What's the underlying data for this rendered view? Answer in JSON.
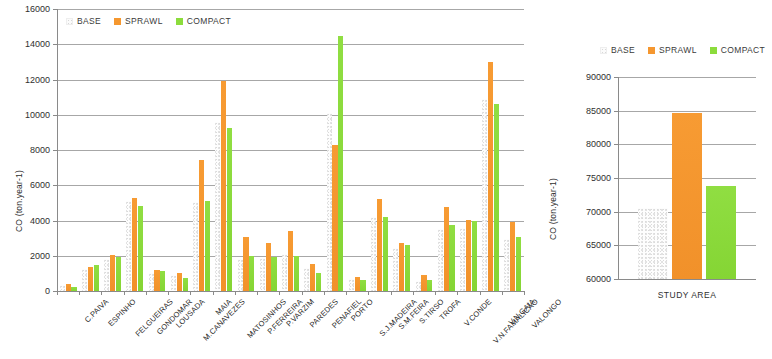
{
  "chart_data": [
    {
      "id": "municipality-chart",
      "type": "bar",
      "title": "",
      "xlabel": "",
      "ylabel": "CO (ton.year-1)",
      "ylim": [
        0,
        16000
      ],
      "ytick_step": 2000,
      "yticks": [
        "0",
        "2000",
        "4000",
        "6000",
        "8000",
        "10000",
        "12000",
        "14000",
        "16000"
      ],
      "grid": true,
      "legend_position": "top-left",
      "legend": [
        "BASE",
        "SPRAWL",
        "COMPACT"
      ],
      "colors": {
        "BASE": "#fafafa",
        "SPRAWL": "#f5972f",
        "COMPACT": "#8cdc3c"
      },
      "categories": [
        "C.PAIVA",
        "ESPINHO",
        "FELGUEIRAS",
        "GONDOMAR",
        "LOUSADA",
        "M.CANAVEZES",
        "MAIA",
        "MATOSINHOS",
        "P.FERREIRA",
        "P.VARZIM",
        "PAREDES",
        "PENAFIEL",
        "PORTO",
        "S.J.MADEIRA",
        "S.M.FEIRA",
        "S.TIRSO",
        "TROFA",
        "V.CONDE",
        "V.N.FAMALICÃO",
        "V.N.GAIA",
        "VALONGO"
      ],
      "series": [
        {
          "name": "BASE",
          "values": [
            330,
            1250,
            1800,
            5100,
            1050,
            900,
            5050,
            9600,
            1800,
            1850,
            2100,
            1300,
            10100,
            700,
            4200,
            2450,
            550,
            3500,
            3550,
            10900,
            2950
          ]
        },
        {
          "name": "SPRAWL",
          "values": [
            400,
            1350,
            2050,
            5250,
            1200,
            1000,
            7450,
            11900,
            3050,
            2750,
            3400,
            1550,
            8300,
            800,
            5200,
            2750,
            900,
            4750,
            4050,
            13000,
            3900
          ]
        },
        {
          "name": "COMPACT",
          "values": [
            250,
            1500,
            1950,
            4800,
            1150,
            750,
            5100,
            9250,
            2000,
            1950,
            2000,
            1050,
            14450,
            650,
            4200,
            2600,
            650,
            3750,
            3950,
            10600,
            3050
          ]
        }
      ]
    },
    {
      "id": "study-area-chart",
      "type": "bar",
      "title": "",
      "xlabel": "",
      "ylabel": "CO (ton.year-1)",
      "ylim": [
        60000,
        90000
      ],
      "ytick_step": 5000,
      "yticks": [
        "60000",
        "65000",
        "70000",
        "75000",
        "80000",
        "85000",
        "90000"
      ],
      "grid": true,
      "legend_position": "top",
      "legend": [
        "BASE",
        "SPRAWL",
        "COMPACT"
      ],
      "colors": {
        "BASE": "#fafafa",
        "SPRAWL": "#f5972f",
        "COMPACT": "#8cdc3c"
      },
      "categories": [
        "STUDY AREA"
      ],
      "series": [
        {
          "name": "BASE",
          "values": [
            70600
          ]
        },
        {
          "name": "SPRAWL",
          "values": [
            84600
          ]
        },
        {
          "name": "COMPACT",
          "values": [
            73800
          ]
        }
      ]
    }
  ]
}
